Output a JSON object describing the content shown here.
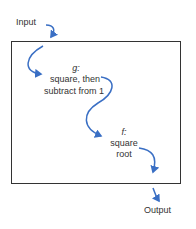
{
  "diagram": {
    "input_label": "Input",
    "output_label": "Output",
    "g": {
      "name": "g:",
      "line1": "square, then",
      "line2": "subtract from 1"
    },
    "f": {
      "name": "f:",
      "line1": "square",
      "line2": "root"
    },
    "colors": {
      "arrow": "#3a6fc4",
      "border": "#333333",
      "text": "#333333"
    }
  }
}
